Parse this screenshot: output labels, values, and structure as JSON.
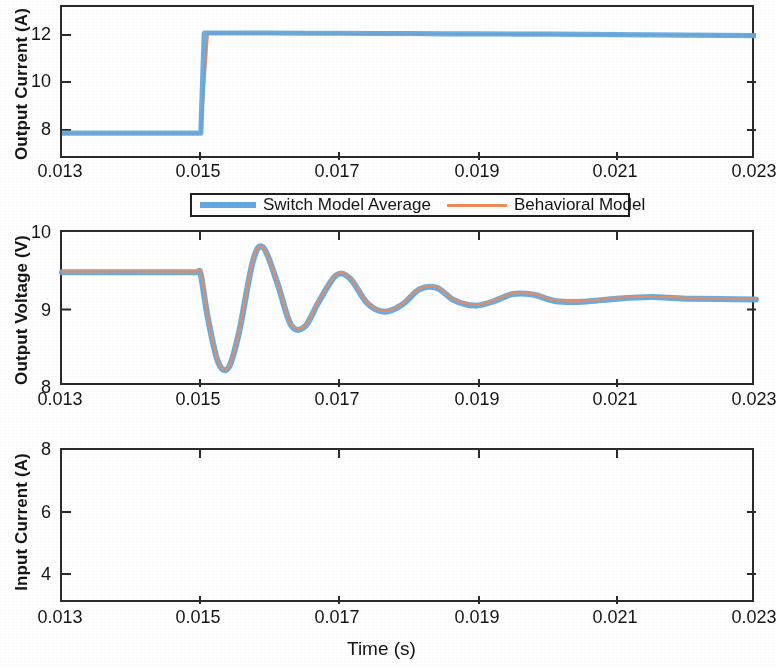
{
  "figure": {
    "background_color": "#ffffff",
    "axis_color": "#2b2b2b",
    "series_colors": {
      "switch_model_average": "#61a8e0",
      "behavioral_model": "#ed8c5a"
    }
  },
  "legend": {
    "position": "between panel 1 and panel 2, centered",
    "entries": [
      {
        "label": "Switch Model Average",
        "color": "#61a8e0",
        "style": "thick-line",
        "icon": "line-swatch-icon"
      },
      {
        "label": "Behavioral Model",
        "color": "#ed8c5a",
        "style": "thin-line",
        "icon": "line-swatch-icon"
      }
    ]
  },
  "xaxis": {
    "label": "Time (s)",
    "ticks": [
      "0.013",
      "0.015",
      "0.017",
      "0.019",
      "0.021",
      "0.023"
    ],
    "range": [
      0.013,
      0.023
    ]
  },
  "chart_data": [
    {
      "type": "line",
      "id": "output-current",
      "title": "",
      "xlabel": "Time (s)",
      "ylabel": "Output Current (A)",
      "xlim": [
        0.013,
        0.023
      ],
      "ylim": [
        7.0,
        13.0
      ],
      "yticks": [
        8,
        10,
        12
      ],
      "xticks": [
        0.013,
        0.015,
        0.017,
        0.019,
        0.021,
        0.023
      ],
      "grid": false,
      "legend": "external-top",
      "series": [
        {
          "name": "Switch Model Average",
          "color": "#61a8e0",
          "x": [
            0.013,
            0.0135,
            0.014,
            0.0145,
            0.01495,
            0.015,
            0.01505,
            0.0152,
            0.0155,
            0.016,
            0.0165,
            0.017,
            0.0175,
            0.018,
            0.0185,
            0.019,
            0.0195,
            0.02,
            0.0205,
            0.021,
            0.0215,
            0.022,
            0.023
          ],
          "values": [
            8.05,
            8.05,
            8.05,
            8.05,
            8.05,
            8.05,
            11.98,
            11.98,
            11.98,
            11.98,
            11.97,
            11.97,
            11.96,
            11.96,
            11.95,
            11.95,
            11.94,
            11.94,
            11.93,
            11.92,
            11.91,
            11.9,
            11.88
          ]
        },
        {
          "name": "Behavioral Model",
          "color": "#ed8c5a",
          "x": [
            0.013,
            0.0149,
            0.015,
            0.0151,
            0.023
          ],
          "values": [
            8.05,
            8.05,
            8.05,
            11.98,
            11.88
          ]
        }
      ]
    },
    {
      "type": "line",
      "id": "output-voltage",
      "title": "",
      "xlabel": "Time (s)",
      "ylabel": "Output Voltage (V)",
      "xlim": [
        0.013,
        0.023
      ],
      "ylim": [
        8.0,
        10.0
      ],
      "yticks": [
        8,
        9,
        10
      ],
      "xticks": [
        0.013,
        0.015,
        0.017,
        0.019,
        0.021,
        0.023
      ],
      "grid": false,
      "series": [
        {
          "name": "Switch Model Average",
          "color": "#61a8e0",
          "x": [
            0.013,
            0.0135,
            0.014,
            0.0145,
            0.0148,
            0.01495,
            0.015,
            0.0151,
            0.01525,
            0.0154,
            0.01555,
            0.01575,
            0.0159,
            0.0161,
            0.0163,
            0.0165,
            0.0167,
            0.01695,
            0.01715,
            0.0174,
            0.01765,
            0.0179,
            0.01815,
            0.0184,
            0.01865,
            0.01895,
            0.0192,
            0.0195,
            0.0198,
            0.0201,
            0.0205,
            0.021,
            0.0215,
            0.022,
            0.023
          ],
          "values": [
            9.48,
            9.48,
            9.48,
            9.48,
            9.48,
            9.48,
            9.45,
            8.9,
            8.32,
            8.25,
            8.7,
            9.62,
            9.8,
            9.35,
            8.8,
            8.78,
            9.1,
            9.44,
            9.4,
            9.08,
            8.97,
            9.06,
            9.26,
            9.28,
            9.12,
            9.05,
            9.1,
            9.2,
            9.19,
            9.11,
            9.1,
            9.14,
            9.16,
            9.14,
            9.13
          ]
        },
        {
          "name": "Behavioral Model",
          "color": "#ed8c5a",
          "x": [
            0.013,
            0.0148,
            0.015,
            0.0151,
            0.01525,
            0.0154,
            0.01555,
            0.01575,
            0.0159,
            0.0161,
            0.0163,
            0.0165,
            0.0167,
            0.01695,
            0.01715,
            0.0174,
            0.01765,
            0.0179,
            0.01815,
            0.0184,
            0.01865,
            0.01895,
            0.0192,
            0.0195,
            0.0198,
            0.0201,
            0.0205,
            0.021,
            0.0215,
            0.022,
            0.023
          ],
          "values": [
            9.49,
            9.49,
            9.46,
            8.91,
            8.33,
            8.26,
            8.71,
            9.63,
            9.8,
            9.36,
            8.81,
            8.79,
            9.11,
            9.45,
            9.41,
            9.09,
            8.98,
            9.07,
            9.27,
            9.29,
            9.13,
            9.06,
            9.11,
            9.21,
            9.2,
            9.12,
            9.11,
            9.15,
            9.17,
            9.15,
            9.14
          ]
        }
      ]
    },
    {
      "type": "line",
      "id": "input-current",
      "title": "",
      "xlabel": "Time (s)",
      "ylabel": "Input Current (A)",
      "xlim": [
        3.2,
        8.0
      ],
      "ylim": [
        3.2,
        8.0
      ],
      "yticks": [
        4,
        6,
        8
      ],
      "xticks": [
        0.013,
        0.015,
        0.017,
        0.019,
        0.021,
        0.023
      ],
      "grid": false,
      "series": [
        {
          "name": "Switch Model Average",
          "color": "#61a8e0",
          "x": [
            0.013,
            0.0135,
            0.014,
            0.0145,
            0.0149,
            0.01505,
            0.0152,
            0.01535,
            0.0155,
            0.01565,
            0.01585,
            0.01605,
            0.0162,
            0.0164,
            0.0166,
            0.0168,
            0.017,
            0.0172,
            0.01745,
            0.0177,
            0.01795,
            0.0182,
            0.0185,
            0.0188,
            0.0191,
            0.01945,
            0.0198,
            0.0202,
            0.0207,
            0.0212,
            0.0218,
            0.0224,
            0.023
          ],
          "values": [
            4.07,
            4.07,
            4.06,
            4.06,
            4.06,
            4.2,
            4.9,
            6.3,
            7.25,
            7.33,
            6.7,
            5.7,
            5.25,
            5.45,
            6.15,
            6.5,
            6.3,
            5.8,
            5.72,
            6.08,
            6.3,
            6.18,
            5.9,
            5.86,
            6.02,
            6.05,
            5.95,
            5.92,
            5.98,
            5.99,
            5.95,
            5.95,
            5.93
          ]
        },
        {
          "name": "Behavioral Model",
          "color": "#ed8c5a",
          "x": [
            0.013,
            0.0145,
            0.0149,
            0.01505,
            0.0152,
            0.01535,
            0.0155,
            0.01565,
            0.01585,
            0.01605,
            0.0162,
            0.0164,
            0.0166,
            0.0168,
            0.017,
            0.0172,
            0.01745,
            0.0177,
            0.01795,
            0.0182,
            0.0185,
            0.0188,
            0.0191,
            0.01945,
            0.0198,
            0.0202,
            0.0207,
            0.0212,
            0.0218,
            0.0224,
            0.023
          ],
          "values": [
            4.08,
            4.08,
            4.08,
            4.26,
            5.0,
            6.4,
            7.32,
            7.36,
            6.72,
            5.72,
            5.27,
            5.47,
            6.16,
            6.48,
            6.28,
            5.8,
            5.74,
            6.07,
            6.28,
            6.17,
            5.92,
            5.88,
            6.0,
            6.03,
            5.96,
            5.93,
            5.97,
            5.98,
            5.96,
            5.96,
            5.94
          ]
        }
      ]
    }
  ]
}
